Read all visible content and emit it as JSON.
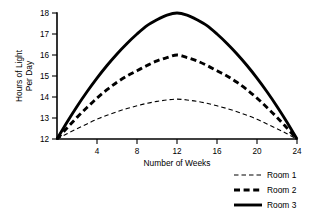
{
  "chart_data": {
    "type": "line",
    "title": "",
    "xlabel": "Number of Weeks",
    "ylabel": "Hours of Light Per Day",
    "ylabel_line1": "Hours of Light",
    "ylabel_line2": "Per Day",
    "xlim": [
      0,
      24
    ],
    "ylim": [
      12,
      18
    ],
    "xticks": [
      4,
      8,
      12,
      16,
      20,
      24
    ],
    "xtick_labels": [
      "4",
      "8",
      "12",
      "16",
      "20",
      "24"
    ],
    "yticks": [
      12,
      13,
      14,
      15,
      16,
      17,
      18
    ],
    "ytick_labels": [
      "12",
      "13",
      "14",
      "15",
      "16",
      "17",
      "18"
    ],
    "grid": false,
    "legend_position": "bottom-right",
    "x": [
      0,
      1,
      2,
      3,
      4,
      5,
      6,
      7,
      8,
      9,
      10,
      11,
      12,
      13,
      14,
      15,
      16,
      17,
      18,
      19,
      20,
      21,
      22,
      23,
      24
    ],
    "series": [
      {
        "name": "Room 1",
        "style": "thin-dashed",
        "color": "#000000",
        "peak_week": 12,
        "peak_value": 13.9,
        "values": [
          12.0,
          12.25,
          12.49,
          12.72,
          12.94,
          13.13,
          13.3,
          13.45,
          13.58,
          13.7,
          13.79,
          13.86,
          13.9,
          13.86,
          13.79,
          13.7,
          13.58,
          13.45,
          13.3,
          13.13,
          12.94,
          12.72,
          12.49,
          12.25,
          12.0
        ]
      },
      {
        "name": "Room 2",
        "style": "thick-dashed",
        "color": "#000000",
        "peak_week": 12,
        "peak_value": 16.0,
        "values": [
          12.0,
          12.52,
          13.03,
          13.5,
          13.95,
          14.35,
          14.7,
          15.0,
          15.25,
          15.5,
          15.72,
          15.88,
          16.0,
          15.88,
          15.72,
          15.5,
          15.25,
          15.0,
          14.7,
          14.35,
          13.95,
          13.5,
          13.03,
          12.52,
          12.0
        ]
      },
      {
        "name": "Room 3",
        "style": "thick-solid",
        "color": "#000000",
        "peak_week": 12,
        "peak_value": 18.0,
        "values": [
          12.0,
          12.8,
          13.55,
          14.25,
          14.9,
          15.5,
          16.05,
          16.55,
          17.0,
          17.4,
          17.68,
          17.9,
          18.0,
          17.9,
          17.68,
          17.4,
          17.0,
          16.55,
          16.05,
          15.5,
          14.9,
          14.25,
          13.55,
          12.8,
          12.0
        ]
      }
    ],
    "legend": [
      {
        "label": "Room 1",
        "style": "thin-dashed"
      },
      {
        "label": "Room 2",
        "style": "thick-dashed"
      },
      {
        "label": "Room 3",
        "style": "thick-solid"
      }
    ]
  }
}
